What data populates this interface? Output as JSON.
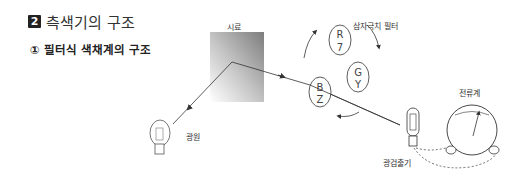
{
  "heading": {
    "number": "2",
    "title": "측색기의 구조"
  },
  "subheading": {
    "text": "① 필터식 색채계의 구조"
  },
  "diagram": {
    "labels": {
      "sample": "시료",
      "tristimulus_filter": "삼자극치 필터",
      "ammeter": "전류계",
      "light_source": "광원",
      "photodetector": "광검출기"
    },
    "filters": [
      {
        "top": "R",
        "bottom": "7"
      },
      {
        "top": "G",
        "bottom": "Y"
      },
      {
        "top": "B",
        "bottom": "Z"
      }
    ],
    "colors": {
      "line": "#333333",
      "sample_dark": "#8a8a8a",
      "sample_light": "#ffffff"
    }
  }
}
